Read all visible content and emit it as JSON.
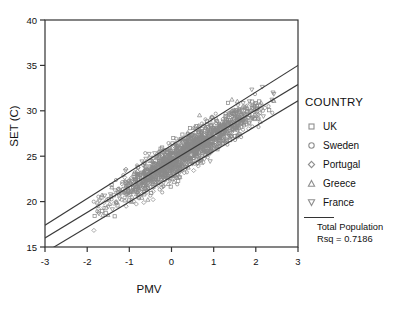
{
  "chart_data": {
    "type": "scatter",
    "title": "",
    "xlabel": "PMV",
    "ylabel": "SET (C)",
    "xlim": [
      -3,
      3
    ],
    "ylim": [
      15,
      40
    ],
    "xticks": [
      -3,
      -2,
      -1,
      0,
      1,
      2,
      3
    ],
    "xticklabels": [
      "-3",
      "-2",
      "-1",
      "0",
      "1",
      "2",
      "3"
    ],
    "yticks": [
      15,
      20,
      25,
      30,
      35,
      40
    ],
    "yticklabels": [
      "15",
      "20",
      "25",
      "30",
      "35",
      "40"
    ],
    "grid": false,
    "legend_position": "right-outside",
    "legend_title": "COUNTRY",
    "series": [
      {
        "name": "UK",
        "marker": "square"
      },
      {
        "name": "Sweden",
        "marker": "circle"
      },
      {
        "name": "Portugal",
        "marker": "diamond"
      },
      {
        "name": "Greece",
        "marker": "triangle-up"
      },
      {
        "name": "France",
        "marker": "triangle-down"
      }
    ],
    "fit_lines": [
      {
        "name": "Total Population",
        "role": "regression-fit",
        "x": [
          -3,
          3
        ],
        "y": [
          16.0,
          32.9
        ],
        "style": "solid"
      },
      {
        "name": "Upper band",
        "role": "confidence-upper",
        "x": [
          -3,
          3
        ],
        "y": [
          17.4,
          35.0
        ],
        "style": "solid"
      },
      {
        "name": "Lower band",
        "role": "confidence-lower",
        "x": [
          -3,
          3
        ],
        "y": [
          14.4,
          31.1
        ],
        "style": "solid"
      }
    ],
    "annotations": [
      {
        "text": "Total Population",
        "kind": "legend-note"
      },
      {
        "text": "Rsq = 0.7186",
        "kind": "legend-note"
      }
    ],
    "rsq": 0.7186,
    "point_cloud": {
      "description": "dense elongated positively-correlated cloud of gray open markers",
      "x_range": [
        -1.7,
        2.3
      ],
      "y_range": [
        18.8,
        32.5
      ],
      "approx_n": 1600,
      "color": "#8a8a8a"
    }
  },
  "legend": {
    "title": "COUNTRY",
    "items": [
      {
        "label": "UK",
        "marker": "square"
      },
      {
        "label": "Sweden",
        "marker": "circle"
      },
      {
        "label": "Portugal",
        "marker": "diamond"
      },
      {
        "label": "Greece",
        "marker": "triangle-up"
      },
      {
        "label": "France",
        "marker": "triangle-down"
      }
    ],
    "footer_line1": "Total Population",
    "footer_line2": "Rsq = 0.7186"
  },
  "axes": {
    "x_title": "PMV",
    "y_title": "SET (C)"
  },
  "colors": {
    "frame": "#333333",
    "line": "#3a3a3a",
    "marker": "#8f8f8f",
    "text": "#111111",
    "background": "#ffffff"
  }
}
